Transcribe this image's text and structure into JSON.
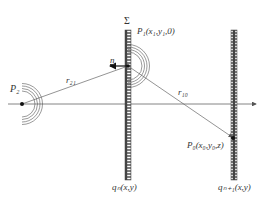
{
  "diagram": {
    "type": "wave-propagation-schematic",
    "labels": {
      "sigma": "Σ",
      "p1": "P₁(x₁,y₁,0)",
      "p2": "P₂",
      "p0": "P₀(x₀,y₀,z)",
      "r21": "r₂₁",
      "r10": "r₁₀",
      "n": "n",
      "qn": "qₙ(x,y)",
      "qn1": "qₙ₊₁(x,y)"
    },
    "points": {
      "P2": [
        22,
        104
      ],
      "P1": [
        128,
        66
      ],
      "P0": [
        233,
        138
      ]
    },
    "screens": [
      {
        "name": "Σ",
        "x": 128,
        "y_top": 30,
        "y_bottom": 180
      },
      {
        "name": "qn+1",
        "x": 234,
        "y_top": 30,
        "y_bottom": 180
      }
    ],
    "axis": {
      "y": 104,
      "x_start": 8,
      "x_end": 258
    },
    "colors": {
      "line": "#555555",
      "screen": "#444444",
      "point": "#111111"
    }
  }
}
